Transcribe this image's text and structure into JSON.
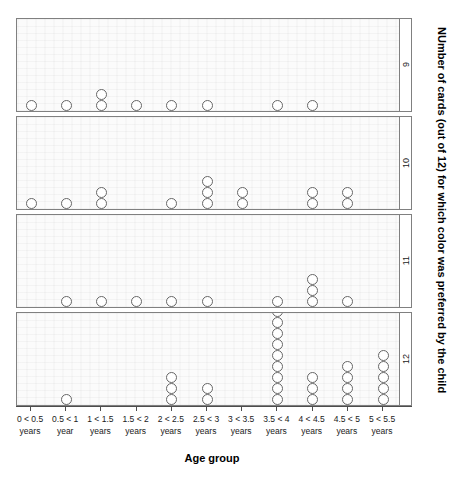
{
  "chart_data": {
    "type": "scatter",
    "plot_style": "dot-plot (stacked circles), lattice/trellis panels",
    "title": "",
    "xlabel": "Age group",
    "ylabel": "NUmber of cards (out of 12) for which color was preferred by the child",
    "panel_variable": "Number of cards (out of 12) for which color was preferred by the child",
    "categories": [
      "0 < 0.5 years",
      "0.5 < 1 year",
      "1 < 1.5 years",
      "1.5 < 2 years",
      "2 < 2.5 years",
      "2.5 < 3 years",
      "3 < 3.5 years",
      "3.5 < 4 years",
      "4 < 4.5 years",
      "4.5 < 5 years",
      "5 < 5.5 years"
    ],
    "category_lines": [
      [
        "0 < 0.5",
        "years"
      ],
      [
        "0.5 < 1",
        "year"
      ],
      [
        "1 < 1.5",
        "years"
      ],
      [
        "1.5 < 2",
        "years"
      ],
      [
        "2 < 2.5",
        "years"
      ],
      [
        "2.5 < 3",
        "years"
      ],
      [
        "3 < 3.5",
        "years"
      ],
      [
        "3.5 < 4",
        "years"
      ],
      [
        "4 < 4.5",
        "years"
      ],
      [
        "4.5 < 5",
        "years"
      ],
      [
        "5 < 5.5",
        "years"
      ]
    ],
    "panels": [
      {
        "strip_label": "9",
        "counts": [
          1,
          1,
          2,
          1,
          1,
          1,
          0,
          1,
          1,
          0,
          0
        ]
      },
      {
        "strip_label": "10",
        "counts": [
          1,
          1,
          2,
          0,
          1,
          3,
          2,
          0,
          2,
          2,
          0
        ]
      },
      {
        "strip_label": "11",
        "counts": [
          0,
          1,
          1,
          1,
          1,
          1,
          0,
          1,
          3,
          1,
          0
        ]
      },
      {
        "strip_label": "12",
        "counts": [
          0,
          1,
          0,
          0,
          3,
          2,
          0,
          9,
          3,
          4,
          5
        ]
      }
    ],
    "grid": false,
    "legend": "none",
    "marker": "open circle",
    "marker_color": "#666666",
    "panel_background": "#fbfbfb",
    "panel_border_color": "#808080"
  }
}
